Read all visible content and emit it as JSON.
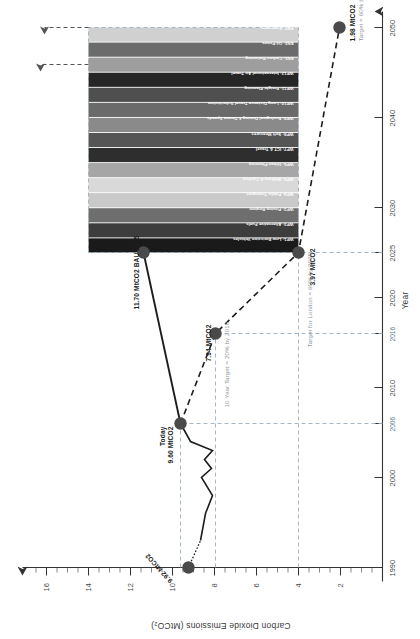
{
  "chart_data": {
    "type": "area",
    "title": "",
    "xlabel": "Year",
    "ylabel": "Carbon Dioxide Emissions (MtCO₂)",
    "xlim": [
      1990,
      2055
    ],
    "ylim": [
      0,
      17
    ],
    "x_ticks": [
      "1990",
      "2000",
      "2006",
      "2010",
      "2016",
      "2020",
      "2025",
      "2030",
      "2040",
      "2050"
    ],
    "x_tick_values": [
      1990,
      2000,
      2006,
      2010,
      2016,
      2020,
      2025,
      2030,
      2040,
      2050
    ],
    "x_tick_highlight": [
      "2006",
      "2016"
    ],
    "y_ticks": [
      "2",
      "4",
      "6",
      "8",
      "10",
      "12",
      "14",
      "16"
    ],
    "y_tick_values": [
      2,
      4,
      6,
      8,
      10,
      12,
      14,
      16
    ],
    "grid": false,
    "legend": "inline-wedge-labels",
    "series": [
      {
        "name": "Historic emissions",
        "style": "dotted-solid-line",
        "points": [
          {
            "year": 1990,
            "value": 9.92
          },
          {
            "year": 1993,
            "value": 9.35
          },
          {
            "year": 1996,
            "value": 9.1
          },
          {
            "year": 1999,
            "value": 8.75
          },
          {
            "year": 2000,
            "value": 9.25
          },
          {
            "year": 2001,
            "value": 8.8
          },
          {
            "year": 2002,
            "value": 9.15
          },
          {
            "year": 2003,
            "value": 8.95
          },
          {
            "year": 2004,
            "value": 9.3
          },
          {
            "year": 2006,
            "value": 9.6
          }
        ]
      },
      {
        "name": "Business as usual (BAU)",
        "style": "solid-line",
        "points": [
          {
            "year": 2006,
            "value": 9.6
          },
          {
            "year": 2025,
            "value": 11.7
          }
        ]
      },
      {
        "name": "Target trajectory",
        "style": "dashed-line",
        "points": [
          {
            "year": 2006,
            "value": 9.6
          },
          {
            "year": 2016,
            "value": 7.94
          },
          {
            "year": 2025,
            "value": 3.97
          },
          {
            "year": 2050,
            "value": 1.98
          }
        ]
      }
    ],
    "markers": [
      {
        "year": 1990,
        "value": 9.92,
        "label": "9.92 MtCO2",
        "sub": ""
      },
      {
        "year": 2006,
        "value": 9.6,
        "label": "9.60 MtCO2",
        "sub": "Today"
      },
      {
        "year": 2016,
        "value": 7.94,
        "label": "7.94 MtCO2",
        "sub": ""
      },
      {
        "year": 2025,
        "value": 11.7,
        "label": "11.70 MtCO2 BAU 2025",
        "sub": ""
      },
      {
        "year": 2025,
        "value": 3.97,
        "label": "3.97 MtCO2",
        "sub": ""
      },
      {
        "year": 2050,
        "value": 1.98,
        "label": "1.98 MtCO2",
        "sub": "Target = 60% by 2050"
      }
    ],
    "annotations": [
      {
        "name": "ten-year-target",
        "text": "10 Year Target = 20% by 2016"
      },
      {
        "name": "london-target",
        "text": "Target for London = 60% by 2025"
      },
      {
        "name": "bau-2025",
        "text": "11.70 MtCO2 BAU 2025"
      },
      {
        "name": "today",
        "text": "Today"
      },
      {
        "name": "target-2050",
        "text": "Target = 60% by 2050"
      }
    ],
    "wedges": {
      "x_start": 2025,
      "x_end": 2050,
      "y_bottom": 3.97,
      "y_top": 11.7,
      "items": [
        {
          "id": "WP1",
          "label": "WP1: Low Emission Vehicles",
          "color": "#1a1a1a"
        },
        {
          "id": "WP2",
          "label": "WP2: Alternative Fuels",
          "color": "#3d3d3d"
        },
        {
          "id": "WP3",
          "label": "WP3: Pricing Regime",
          "color": "#6e6e6e"
        },
        {
          "id": "WP4",
          "label": "WP4: Public Transport",
          "color": "#c9c9c9"
        },
        {
          "id": "WP5",
          "label": "WP5: Walking & Cycling",
          "color": "#d9d9d9"
        },
        {
          "id": "WP6",
          "label": "WP6: Urban Planning",
          "color": "#a6a6a6"
        },
        {
          "id": "WP7",
          "label": "WP7: ICT & Travel",
          "color": "#2e2e2e"
        },
        {
          "id": "WP8",
          "label": "WP8: Soft Measures",
          "color": "#555555"
        },
        {
          "id": "WP9",
          "label": "WP9: Ecological Driving & Deram Speeds",
          "color": "#8a8a8a"
        },
        {
          "id": "WP10",
          "label": "WP10: Long Distance Travel Substitution",
          "color": "#6a6a6a"
        },
        {
          "id": "WP11",
          "label": "WP11: Freight Planning",
          "color": "#4f4f4f"
        },
        {
          "id": "WP12",
          "label": "WP12: International Air Travel",
          "color": "#262626"
        },
        {
          "id": "EN1",
          "label": "EN1: Carbon Rationing",
          "color": "#9e9e9e"
        },
        {
          "id": "EN2",
          "label": "EN2: Oil Prices",
          "color": "#6b6b6b"
        },
        {
          "id": "EN3",
          "label": "EN3: Synergies",
          "color": "#d0d0d0"
        }
      ]
    }
  }
}
